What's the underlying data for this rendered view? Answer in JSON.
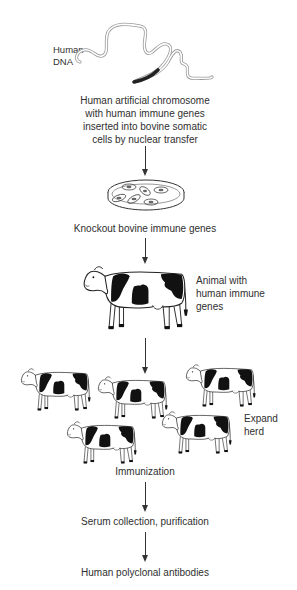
{
  "diagram": {
    "title": "",
    "steps": [
      {
        "id": "dna",
        "label_lines": [
          "Human",
          "DNA"
        ],
        "icon": "dna-strand-icon"
      },
      {
        "id": "hac",
        "label_lines": [
          "Human artificial chromosome",
          "with human immune genes",
          "inserted into bovine somatic",
          "cells by nuclear transfer"
        ]
      },
      {
        "id": "knockout",
        "label": "Knockout bovine immune genes",
        "icon": "petri-dish-icon"
      },
      {
        "id": "animal",
        "label_lines": [
          "Animal with",
          "human immune",
          "genes"
        ],
        "icon": "cow-icon"
      },
      {
        "id": "herd",
        "label_lines": [
          "Expand",
          "herd"
        ],
        "icon": "cow-herd-icon",
        "cow_count": 5
      },
      {
        "id": "immunization",
        "label": "Immunization"
      },
      {
        "id": "serum",
        "label": "Serum collection, purification"
      },
      {
        "id": "antibodies",
        "label": "Human polyclonal antibodies"
      }
    ],
    "colors": {
      "line": "#333333",
      "text": "#2f2f2f",
      "patch": "#111111",
      "gene_segment": "#222222",
      "background": "#ffffff"
    }
  }
}
